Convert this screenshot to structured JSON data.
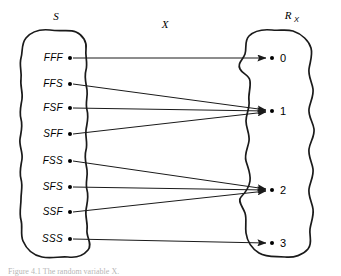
{
  "figure": {
    "type": "mapping-diagram",
    "domain_set": {
      "label": "S",
      "label_kind": "script-italic-S",
      "elements": [
        {
          "id": "FFF",
          "label": "FFF",
          "x": 70,
          "y": 58
        },
        {
          "id": "FFS",
          "label": "FFS",
          "x": 70,
          "y": 84
        },
        {
          "id": "FSF",
          "label": "FSF",
          "x": 70,
          "y": 108
        },
        {
          "id": "SFF",
          "label": "SFF",
          "x": 70,
          "y": 134
        },
        {
          "id": "FSS",
          "label": "FSS",
          "x": 70,
          "y": 161
        },
        {
          "id": "SFS",
          "label": "SFS",
          "x": 70,
          "y": 187
        },
        {
          "id": "SSF",
          "label": "SSF",
          "x": 70,
          "y": 212
        },
        {
          "id": "SSS",
          "label": "SSS",
          "x": 70,
          "y": 239
        }
      ]
    },
    "map_label": "X",
    "range_set": {
      "label_base": "R",
      "label_subscript": "X",
      "elements": [
        {
          "id": "0",
          "label": "0",
          "x": 277,
          "y": 58
        },
        {
          "id": "1",
          "label": "1",
          "x": 277,
          "y": 111
        },
        {
          "id": "2",
          "label": "2",
          "x": 277,
          "y": 190
        },
        {
          "id": "3",
          "label": "3",
          "x": 277,
          "y": 243
        }
      ]
    },
    "mappings": [
      {
        "from": "FFF",
        "to": "0"
      },
      {
        "from": "FFS",
        "to": "1"
      },
      {
        "from": "FSF",
        "to": "1"
      },
      {
        "from": "SFF",
        "to": "1"
      },
      {
        "from": "FSS",
        "to": "2"
      },
      {
        "from": "SFS",
        "to": "2"
      },
      {
        "from": "SSF",
        "to": "2"
      },
      {
        "from": "SSS",
        "to": "3"
      }
    ],
    "colors": {
      "stroke": "#1a1a1a",
      "background": "#ffffff",
      "text": "#000000"
    }
  },
  "caption": {
    "text": "Figure 4.1  The random variable X."
  }
}
